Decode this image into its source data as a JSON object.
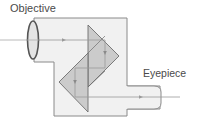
{
  "diagram": {
    "labels": {
      "objective": "Objective",
      "eyepiece": "Eyepiece"
    },
    "colors": {
      "body_fill": "#f1f1f1",
      "body_stroke": "#8a8a8a",
      "prism_fill": "#c4c4c4",
      "prism_stroke": "#6e6e6e",
      "ray": "#9a9a9a",
      "lens_stroke": "#555555",
      "text": "#4a4a4a"
    },
    "components": [
      {
        "id": "objective-lens",
        "shape": "ellipse"
      },
      {
        "id": "upper-prism",
        "shape": "triangle"
      },
      {
        "id": "lower-prism",
        "shape": "triangle"
      },
      {
        "id": "eyepiece-tube",
        "shape": "rounded-rect"
      },
      {
        "id": "housing",
        "shape": "polygon"
      }
    ],
    "light_path": [
      "objective",
      "upper-prism",
      "lower-prism",
      "eyepiece"
    ]
  }
}
